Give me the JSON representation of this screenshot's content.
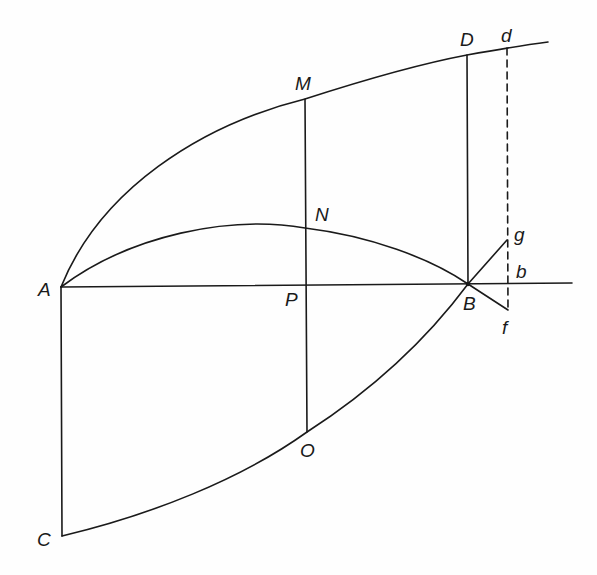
{
  "diagram": {
    "labels": {
      "A": "A",
      "B": "B",
      "C": "C",
      "D": "D",
      "d": "d",
      "M": "M",
      "N": "N",
      "P": "P",
      "O": "O",
      "g": "g",
      "b": "b",
      "f": "f"
    },
    "edge_fragment": "t",
    "stroke_color": "#1a1a1a",
    "elements": [
      "upper curve A-M-D-d",
      "middle arc A-N-B",
      "lower curve C-O-B-g",
      "horizontal line A-P-B-b",
      "vertical A-C",
      "vertical M-N-P-O",
      "vertical D-B",
      "dashed vertical d-b-f",
      "segment B-f"
    ]
  }
}
